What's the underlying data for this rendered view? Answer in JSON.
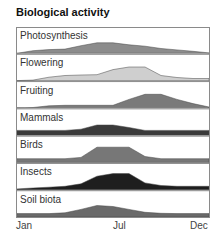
{
  "chart_data": {
    "type": "area",
    "title": "Biological activity",
    "xlabel": "",
    "ylabel": "",
    "x_ticks": [
      "Jan",
      "Jul",
      "Dec"
    ],
    "x": [
      0,
      1,
      2,
      3,
      4,
      5,
      6,
      7,
      8,
      9,
      10,
      11,
      12
    ],
    "x_note": "months from Jan (0) to Dec (11/12); relative activity 0-1",
    "layout": {
      "stacked_panels": true,
      "grid": false,
      "legend": "none (labels inside panels)"
    },
    "series": [
      {
        "name": "Photosynthesis",
        "color": "#8c8c8c",
        "values": [
          0,
          0.15,
          0.22,
          0.25,
          0.45,
          0.62,
          0.62,
          0.5,
          0.42,
          0.28,
          0.2,
          0.12,
          0.02
        ]
      },
      {
        "name": "Flowering",
        "color": "#cfcfcf",
        "values": [
          0,
          0.03,
          0.2,
          0.3,
          0.33,
          0.35,
          0.65,
          0.8,
          0.8,
          0.3,
          0.18,
          0.12,
          0.12
        ]
      },
      {
        "name": "Fruiting",
        "color": "#7a7a7a",
        "values": [
          0,
          0.02,
          0.12,
          0.15,
          0.15,
          0.15,
          0.15,
          0.5,
          0.8,
          0.8,
          0.5,
          0.25,
          0.05
        ]
      },
      {
        "name": "Mammals",
        "color": "#3a3a3a",
        "values": [
          0.28,
          0.28,
          0.28,
          0.28,
          0.35,
          0.6,
          0.6,
          0.45,
          0.28,
          0.28,
          0.28,
          0.28,
          0.28
        ]
      },
      {
        "name": "Birds",
        "color": "#777777",
        "values": [
          0.22,
          0.22,
          0.22,
          0.22,
          0.3,
          0.9,
          0.9,
          0.9,
          0.35,
          0.22,
          0.22,
          0.22,
          0.22
        ]
      },
      {
        "name": "Insects",
        "color": "#1e1e1e",
        "values": [
          0.05,
          0.1,
          0.15,
          0.2,
          0.35,
          0.8,
          0.95,
          0.95,
          0.4,
          0.25,
          0.2,
          0.2,
          0.2
        ]
      },
      {
        "name": "Soil biota",
        "color": "#6a6a6a",
        "values": [
          0.2,
          0.2,
          0.2,
          0.25,
          0.45,
          0.68,
          0.62,
          0.45,
          0.28,
          0.22,
          0.2,
          0.2,
          0.2
        ]
      }
    ]
  }
}
